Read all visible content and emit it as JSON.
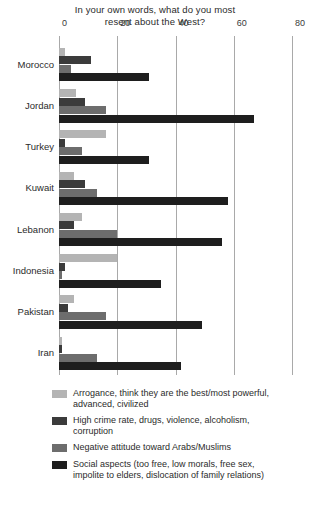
{
  "chart_data": {
    "type": "bar",
    "orientation": "horizontal",
    "title": "In your own words, what do you most resent about the West?",
    "title_lines": [
      "In your own words, what do you most",
      "resent about the West?"
    ],
    "xlabel": "",
    "ylabel": "",
    "xlim": [
      0,
      80
    ],
    "xticks": [
      0,
      20,
      40,
      60,
      80
    ],
    "xtick_labels": [
      "0",
      "20",
      "40",
      "60",
      "80"
    ],
    "grid": true,
    "legend_position": "bottom",
    "categories": [
      "Morocco",
      "Jordan",
      "Turkey",
      "Kuwait",
      "Lebanon",
      "Indonesia",
      "Pakistan",
      "Iran"
    ],
    "series": [
      {
        "name": "Arrogance, think they are the best/most powerful, advanced, civilized",
        "color": "#b4b4b4",
        "values": [
          2,
          6,
          16,
          5,
          8,
          20,
          5,
          1
        ]
      },
      {
        "name": "High crime rate, drugs, violence, alcoholism, corruption",
        "color": "#3b3b3b",
        "values": [
          11,
          9,
          2,
          9,
          5,
          2,
          3,
          1
        ]
      },
      {
        "name": "Negative attitude toward Arabs/Muslims",
        "color": "#6d6d6d",
        "values": [
          4,
          16,
          8,
          13,
          20,
          1,
          16,
          13
        ]
      },
      {
        "name": "Social aspects (too free, low morals, free sex, impolite to elders, dislocation of family relations)",
        "color": "#1e1e1e",
        "values": [
          31,
          67,
          31,
          58,
          56,
          35,
          49,
          42
        ]
      }
    ]
  },
  "legend": {
    "items": [
      {
        "color": "#b4b4b4",
        "lines": [
          "Arrogance, think they are the best/most powerful,",
          "advanced, civilized"
        ]
      },
      {
        "color": "#3b3b3b",
        "lines": [
          "High crime rate, drugs, violence, alcoholism,",
          "corruption"
        ]
      },
      {
        "color": "#6d6d6d",
        "lines": [
          "Negative attitude toward Arabs/Muslims"
        ]
      },
      {
        "color": "#1e1e1e",
        "lines": [
          "Social aspects (too free, low morals, free sex,",
          "impolite to elders, dislocation of family relations)"
        ]
      }
    ]
  }
}
